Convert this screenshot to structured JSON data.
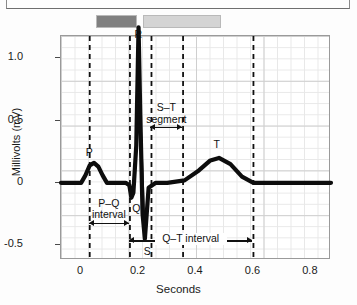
{
  "figure": {
    "title": "",
    "legend_swatches": [
      {
        "name": "dark-swatch",
        "color": "#808080"
      },
      {
        "name": "light-swatch",
        "color": "#d4d4d4"
      }
    ]
  },
  "chart_data": {
    "type": "line",
    "title": "",
    "xlabel": "Seconds",
    "ylabel": "Millivolts (mV)",
    "xlim": [
      -0.07,
      0.87
    ],
    "ylim": [
      -0.62,
      1.18
    ],
    "xticks": [
      "0",
      "0.2",
      "0.4",
      "0.6",
      "0.8"
    ],
    "xtick_values": [
      0,
      0.2,
      0.4,
      0.6,
      0.8
    ],
    "yticks": [
      "1.0",
      "0.5",
      "0",
      "-0.5"
    ],
    "ytick_values": [
      1.0,
      0.5,
      0,
      -0.5
    ],
    "grid": true,
    "legend_position": "none",
    "series": [
      {
        "name": "ECG trace",
        "x": [
          -0.07,
          -0.02,
          0.0,
          0.015,
          0.03,
          0.045,
          0.06,
          0.075,
          0.09,
          0.13,
          0.155,
          0.168,
          0.175,
          0.182,
          0.192,
          0.2,
          0.206,
          0.214,
          0.222,
          0.235,
          0.26,
          0.3,
          0.36,
          0.41,
          0.45,
          0.48,
          0.52,
          0.56,
          0.6,
          0.65,
          0.87
        ],
        "y": [
          0.0,
          0.0,
          0.0,
          0.06,
          0.14,
          0.16,
          0.13,
          0.06,
          0.0,
          0.0,
          0.0,
          -0.02,
          -0.12,
          -0.08,
          0.3,
          1.25,
          0.55,
          -0.25,
          -0.45,
          -0.04,
          0.0,
          0.0,
          0.02,
          0.1,
          0.18,
          0.2,
          0.15,
          0.05,
          0.0,
          0.0,
          0.0
        ]
      }
    ],
    "point_labels": [
      {
        "name": "P",
        "text": "P",
        "x": 0.03,
        "y": 0.23
      },
      {
        "name": "Q",
        "text": "Q",
        "x": 0.192,
        "y": -0.22
      },
      {
        "name": "R",
        "text": "R",
        "x": 0.2,
        "y": 1.18
      },
      {
        "name": "S",
        "text": "S",
        "x": 0.232,
        "y": -0.56
      },
      {
        "name": "T",
        "text": "T",
        "x": 0.475,
        "y": 0.3
      }
    ],
    "annotations": [
      {
        "name": "pq-interval",
        "label": "P–Q",
        "label2": "interval",
        "x_start": 0.03,
        "x_end": 0.17,
        "y": -0.33
      },
      {
        "name": "st-segment",
        "label": "S–T",
        "label2": "segment",
        "x_start": 0.245,
        "x_end": 0.355,
        "y": 0.44
      },
      {
        "name": "qt-interval",
        "label": "Q–T interval",
        "label2": "",
        "x_start": 0.17,
        "x_end": 0.6,
        "y": -0.47
      }
    ],
    "dashed_markers": [
      0.03,
      0.17,
      0.245,
      0.355,
      0.6
    ]
  }
}
